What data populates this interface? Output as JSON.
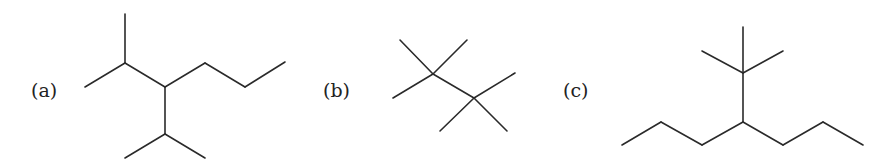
{
  "figure": {
    "structures": [
      {
        "label": "(a)",
        "name": "skeletal-structure-a"
      },
      {
        "label": "(b)",
        "name": "skeletal-structure-b"
      },
      {
        "label": "(c)",
        "name": "skeletal-structure-c"
      }
    ],
    "colors": {
      "line": "#2a2a2a",
      "text": "#222222",
      "background": "#ffffff"
    }
  }
}
